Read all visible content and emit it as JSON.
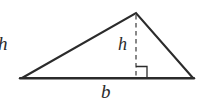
{
  "figure": {
    "kind": "triangle-area-diagram",
    "background_color": "#ffffff",
    "stroke_color": "#2b2b2b",
    "labels": {
      "side_h": "h",
      "altitude_h": "h",
      "base_b": "b"
    },
    "geometry": {
      "left_vertex": [
        22,
        78
      ],
      "apex_vertex": [
        136,
        13
      ],
      "right_vertex": [
        193,
        78
      ],
      "base_line": [
        [
          20,
          78
        ],
        [
          194,
          78
        ]
      ],
      "altitude_line": [
        [
          136,
          14
        ],
        [
          136,
          78
        ]
      ],
      "right_angle_marker": {
        "x": 136,
        "y": 66,
        "size": 11
      }
    },
    "elements": {
      "base_label_text": "b",
      "altitude_label_text": "h",
      "side_label_text": "h",
      "altitude_style": "dashed",
      "outline_style": "solid"
    }
  }
}
